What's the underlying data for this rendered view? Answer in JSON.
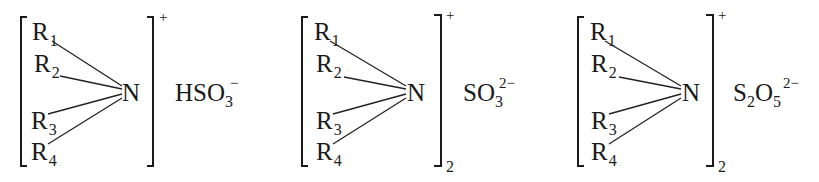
{
  "diagram": {
    "structures": [
      {
        "substituents": [
          "R",
          "R",
          "R",
          "R"
        ],
        "substituent_indices": [
          "1",
          "2",
          "3",
          "4"
        ],
        "center_atom": "N",
        "cation_charge": "+",
        "cation_multiplier": "",
        "anion": {
          "parts": [
            {
              "text": "HSO",
              "sub": "3",
              "sup": "−"
            }
          ]
        }
      },
      {
        "substituents": [
          "R",
          "R",
          "R",
          "R"
        ],
        "substituent_indices": [
          "1",
          "2",
          "3",
          "4"
        ],
        "center_atom": "N",
        "cation_charge": "+",
        "cation_multiplier": "2",
        "anion": {
          "parts": [
            {
              "text": "SO",
              "sub": "3",
              "sup": "2−"
            }
          ]
        }
      },
      {
        "substituents": [
          "R",
          "R",
          "R",
          "R"
        ],
        "substituent_indices": [
          "1",
          "2",
          "3",
          "4"
        ],
        "center_atom": "N",
        "cation_charge": "+",
        "cation_multiplier": "2",
        "anion": {
          "parts": [
            {
              "text": "S",
              "sub": "2",
              "sup": ""
            },
            {
              "text": "O",
              "sub": "5",
              "sup": "2−"
            }
          ]
        }
      }
    ],
    "colors": {
      "ink": "#1a1a1a",
      "background": "#ffffff"
    }
  }
}
